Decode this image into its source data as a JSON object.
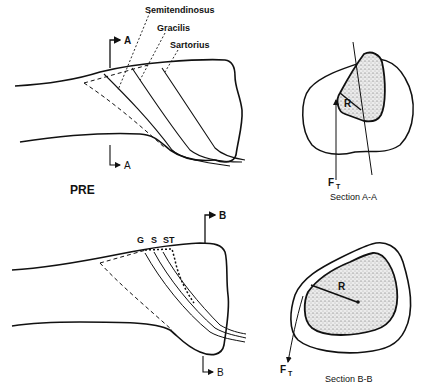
{
  "top_panel": {
    "state_label": "PRE",
    "muscle_labels": [
      "Semitendinosus",
      "Gracilis",
      "Sartorius"
    ],
    "section_marker_top": "A",
    "section_marker_bottom": "A"
  },
  "bottom_panel": {
    "muscle_abbrevs": [
      "G",
      "S",
      "ST"
    ],
    "section_marker_top": "B",
    "section_marker_bottom": "B"
  },
  "section_a": {
    "caption": "Section A-A",
    "radius_label": "R",
    "force_label": "F",
    "force_subscript": "T"
  },
  "section_b": {
    "caption": "Section B-B",
    "radius_label": "R",
    "force_label": "F",
    "force_subscript": "T"
  },
  "colors": {
    "line": "#111111",
    "stipple_fill": "#e6e6e6",
    "background": "#ffffff"
  }
}
